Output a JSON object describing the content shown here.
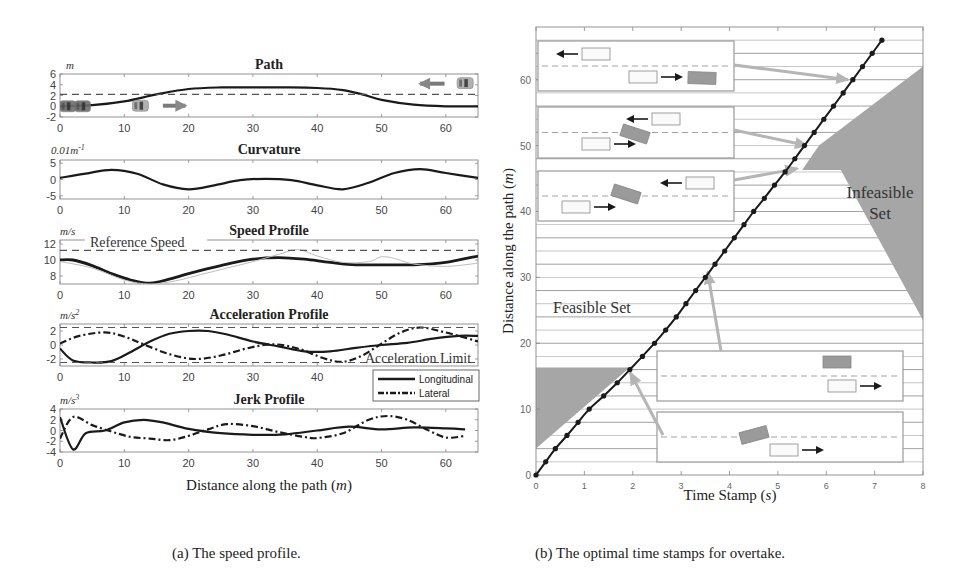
{
  "captions": {
    "a": "(a) The speed profile.",
    "b": "(b) The optimal time stamps for overtake."
  },
  "left_panel": {
    "xlabel": "Distance along the path (m)",
    "xlabel_text": "Distance along the path (",
    "xlabel_unit": "m",
    "xlabel_close": ")",
    "legend": [
      "Longitudinal",
      "Lateral"
    ],
    "annotations": {
      "reference_speed": "Reference Speed",
      "acceleration_limit": "Acceleration Limit"
    }
  },
  "right_panel": {
    "xlabel_text": "Time Stamp (",
    "xlabel_unit": "s",
    "xlabel_close": ")",
    "ylabel_text": "Distance along the path (",
    "ylabel_unit": "m",
    "ylabel_close": ")",
    "feasible_label": "Feasible Set",
    "infeasible_label_1": "Infeasible",
    "infeasible_label_2": "Set"
  },
  "colors": {
    "line": "#1a1a1a",
    "dashed_ref": "#555555",
    "gray_fill": "#a6a6a6",
    "arrow_gray": "#b5b5b5",
    "axis": "#888888",
    "grid": "#8a8a8a",
    "car_gray": "#9a9a9a"
  },
  "chart_data": [
    {
      "type": "line",
      "title": "Path",
      "unit": "m",
      "xlabel": "",
      "ylabel": "m",
      "xlim": [
        0,
        65
      ],
      "ylim": [
        -2,
        6
      ],
      "xticks": [
        0,
        10,
        20,
        30,
        40,
        50,
        60
      ],
      "yticks": [
        -2,
        0,
        2,
        4,
        6
      ],
      "series": [
        {
          "name": "path",
          "style": "solid",
          "x": [
            0,
            5,
            10,
            15,
            20,
            25,
            30,
            35,
            40,
            44,
            47,
            50,
            55,
            60,
            65
          ],
          "y": [
            0,
            0.2,
            0.9,
            2.2,
            3.2,
            3.5,
            3.5,
            3.5,
            3.4,
            3.0,
            2.2,
            1.2,
            0.3,
            0.0,
            0.0
          ]
        },
        {
          "name": "lane divider",
          "style": "dashed",
          "x": [
            0,
            65
          ],
          "y": [
            2.2,
            2.2
          ]
        }
      ]
    },
    {
      "type": "line",
      "title": "Curvature",
      "unit": "0.01m-1",
      "xlim": [
        0,
        65
      ],
      "ylim": [
        -6,
        6
      ],
      "xticks": [
        0,
        10,
        20,
        30,
        40,
        50,
        60
      ],
      "yticks": [
        -5,
        0,
        5
      ],
      "series": [
        {
          "name": "curvature",
          "style": "solid",
          "x": [
            0,
            4,
            8,
            12,
            16,
            20,
            24,
            28,
            32,
            36,
            40,
            44,
            48,
            52,
            56,
            60,
            65
          ],
          "y": [
            0.5,
            1.8,
            3.0,
            1.8,
            -1.5,
            -3.0,
            -1.8,
            -0.2,
            0.2,
            -0.2,
            -1.8,
            -3.0,
            -1.0,
            2.0,
            3.2,
            2.0,
            0.5
          ]
        }
      ]
    },
    {
      "type": "line",
      "title": "Speed Profile",
      "unit": "m/s",
      "xlim": [
        0,
        65
      ],
      "ylim": [
        7,
        12.5
      ],
      "xticks": [
        0,
        10,
        20,
        30,
        40,
        50,
        60
      ],
      "yticks": [
        8,
        10,
        12
      ],
      "series": [
        {
          "name": "optimized speed",
          "style": "solid-bold",
          "x": [
            0,
            2,
            5,
            8,
            11,
            14,
            17,
            20,
            25,
            30,
            34,
            38,
            42,
            46,
            50,
            55,
            60,
            65
          ],
          "y": [
            10,
            10,
            9.3,
            8.3,
            7.5,
            7.1,
            7.6,
            8.3,
            9.3,
            10.1,
            10.3,
            10.1,
            9.7,
            9.4,
            9.4,
            9.4,
            9.7,
            10.5
          ]
        },
        {
          "name": "raw speed",
          "style": "thin-gray",
          "x": [
            0,
            5,
            10,
            14,
            18,
            22,
            26,
            30,
            34,
            37,
            40,
            44,
            48,
            50,
            52,
            55,
            60,
            65
          ],
          "y": [
            9.8,
            9.0,
            7.5,
            7.0,
            7.4,
            8.2,
            9.0,
            9.8,
            10.7,
            11.3,
            10.5,
            9.7,
            9.8,
            10.4,
            10.2,
            9.5,
            9.2,
            9.6
          ]
        },
        {
          "name": "Reference Speed",
          "style": "dashed",
          "x": [
            0,
            65
          ],
          "y": [
            11.2,
            11.2
          ]
        }
      ]
    },
    {
      "type": "line",
      "title": "Acceleration Profile",
      "unit": "m/s2",
      "xlim": [
        0,
        65
      ],
      "ylim": [
        -3,
        3
      ],
      "xticks": [
        0,
        10,
        20,
        30,
        40
      ],
      "yticks": [
        -2,
        0,
        2
      ],
      "series": [
        {
          "name": "Longitudinal",
          "style": "solid",
          "x": [
            0,
            2,
            5,
            8,
            11,
            14,
            17,
            20,
            23,
            26,
            30,
            34,
            38,
            42,
            46,
            50,
            54,
            58,
            62,
            65
          ],
          "y": [
            -0.5,
            -2.2,
            -2.5,
            -2.3,
            -1.0,
            0.5,
            1.6,
            2.0,
            2.0,
            1.5,
            0.5,
            -0.2,
            -0.9,
            -0.9,
            -0.4,
            0.0,
            0.3,
            0.9,
            1.3,
            1.3
          ]
        },
        {
          "name": "Lateral",
          "style": "dashdot",
          "x": [
            0,
            3,
            7,
            10,
            13,
            17,
            21,
            25,
            29,
            33,
            37,
            41,
            44,
            47,
            50,
            53,
            56,
            59,
            62,
            65
          ],
          "y": [
            0.2,
            1.3,
            1.8,
            1.2,
            0.1,
            -1.3,
            -2.0,
            -1.5,
            -0.5,
            0.1,
            -0.5,
            -1.9,
            -2.4,
            -1.5,
            0.2,
            1.8,
            2.5,
            2.0,
            1.3,
            0.5
          ]
        },
        {
          "name": "Acceleration Limit (upper)",
          "style": "dashed",
          "x": [
            0,
            65
          ],
          "y": [
            2.5,
            2.5
          ]
        },
        {
          "name": "Acceleration Limit (lower)",
          "style": "dashed",
          "x": [
            0,
            65
          ],
          "y": [
            -2.5,
            -2.5
          ]
        }
      ],
      "legend": [
        "Longitudinal",
        "Lateral"
      ],
      "legend_position": "below-right"
    },
    {
      "type": "line",
      "title": "Jerk Profile",
      "unit": "m/s3",
      "xlabel": "Distance along the path (m)",
      "xlim": [
        0,
        65
      ],
      "ylim": [
        -4,
        4
      ],
      "xticks": [
        0,
        10,
        20,
        30,
        40,
        50,
        60
      ],
      "yticks": [
        -4,
        -2,
        0,
        2,
        4
      ],
      "series": [
        {
          "name": "Longitudinal",
          "style": "solid",
          "x": [
            0,
            2,
            4,
            7,
            10,
            13,
            16,
            20,
            25,
            30,
            35,
            40,
            45,
            50,
            55,
            60,
            63
          ],
          "y": [
            2.5,
            -3.5,
            -0.5,
            0.0,
            1.5,
            2.0,
            1.5,
            0.3,
            -0.5,
            -0.8,
            -0.7,
            0.0,
            0.7,
            0.2,
            0.6,
            0.4,
            0.2
          ]
        },
        {
          "name": "Lateral",
          "style": "dashdot",
          "x": [
            0,
            2,
            5,
            8,
            11,
            14,
            17,
            20,
            23,
            26,
            30,
            34,
            38,
            40,
            44,
            48,
            51,
            54,
            57,
            60,
            63
          ],
          "y": [
            -1.5,
            2.5,
            1.0,
            -0.2,
            -1.2,
            -1.5,
            -1.8,
            -1.0,
            0.2,
            1.2,
            0.8,
            -0.3,
            -1.2,
            -1.4,
            -0.5,
            2.0,
            2.7,
            2.0,
            0.2,
            -1.3,
            -1.0
          ]
        }
      ]
    },
    {
      "type": "line",
      "title": "The optimal time stamps for overtake",
      "xlabel": "Time Stamp (s)",
      "ylabel": "Distance along the path (m)",
      "xlim": [
        0,
        8
      ],
      "ylim": [
        0,
        68
      ],
      "xticks": [
        0,
        1,
        2,
        3,
        4,
        5,
        6,
        7,
        8
      ],
      "yticks": [
        0,
        10,
        20,
        30,
        40,
        50,
        60
      ],
      "grid": "horizontal every 2 m",
      "series": [
        {
          "name": "optimal trajectory",
          "style": "solid-markers",
          "x": [
            0,
            0.2,
            0.4,
            0.64,
            0.87,
            1.1,
            1.4,
            1.68,
            1.94,
            2.2,
            2.45,
            2.68,
            2.9,
            3.1,
            3.3,
            3.5,
            3.7,
            3.9,
            4.1,
            4.3,
            4.5,
            4.72,
            4.93,
            5.15,
            5.35,
            5.55,
            5.75,
            5.95,
            6.15,
            6.35,
            6.55,
            6.75,
            6.95,
            7.15
          ],
          "y": [
            0,
            2,
            4,
            6,
            8,
            10,
            12,
            14,
            16,
            18,
            20,
            22,
            24,
            26,
            28,
            30,
            32,
            34,
            36,
            38,
            40,
            42,
            44,
            46,
            48,
            50,
            52,
            54,
            56,
            58,
            60,
            62,
            64,
            66
          ]
        }
      ],
      "regions": [
        {
          "name": "Infeasible Set (lower)",
          "polygon_ts": [
            [
              0,
              4
            ],
            [
              0,
              16.3
            ],
            [
              1.94,
              16.3
            ]
          ]
        },
        {
          "name": "Infeasible Set (upper)",
          "polygon_ts": [
            [
              5.5,
              46.3
            ],
            [
              6.3,
              46.3
            ],
            [
              8,
              23.5
            ],
            [
              8,
              62
            ],
            [
              5.85,
              50
            ]
          ]
        }
      ],
      "annotations": [
        "Feasible Set",
        "Infeasible Set"
      ],
      "insets": 5
    }
  ]
}
